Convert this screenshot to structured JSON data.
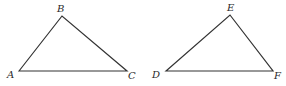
{
  "diagram": {
    "triangles": [
      {
        "name": "ABC",
        "vertices": [
          {
            "label": "A",
            "x": 19,
            "y": 71
          },
          {
            "label": "B",
            "x": 62,
            "y": 16
          },
          {
            "label": "C",
            "x": 127,
            "y": 71
          }
        ]
      },
      {
        "name": "DEF",
        "vertices": [
          {
            "label": "D",
            "x": 166,
            "y": 71
          },
          {
            "label": "E",
            "x": 230,
            "y": 15
          },
          {
            "label": "F",
            "x": 273,
            "y": 71
          }
        ]
      }
    ],
    "stroke_color": "#333333",
    "background": "#ffffff"
  }
}
